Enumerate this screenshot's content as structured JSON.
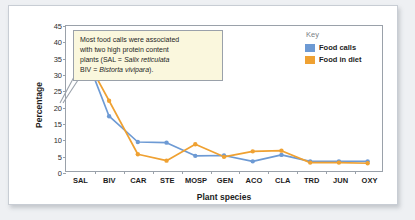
{
  "chart_data": {
    "type": "line",
    "title": "",
    "xlabel": "Plant species",
    "ylabel": "Percentage",
    "categories": [
      "SAL",
      "BIV",
      "CAR",
      "STE",
      "MOSP",
      "GEN",
      "ACO",
      "CLA",
      "TRD",
      "JUN",
      "OXY"
    ],
    "ylim": [
      0,
      45
    ],
    "yticks": [
      0,
      5,
      10,
      15,
      20,
      25,
      30,
      35,
      40,
      45
    ],
    "grid": false,
    "legend_position": "top-right",
    "series": [
      {
        "name": "Food calls",
        "color": "#6d9ad4",
        "values": [
          40,
          17,
          9,
          8.8,
          4.7,
          4.8,
          3,
          5,
          3,
          3,
          3
        ]
      },
      {
        "name": "Food in diet",
        "color": "#efa132",
        "values": [
          38.2,
          21.8,
          5.2,
          3.2,
          8.3,
          4.4,
          6.1,
          6.3,
          2.6,
          2.6,
          2.4
        ]
      }
    ]
  },
  "legend": {
    "title": "Key",
    "items": [
      {
        "label": "Food calls",
        "color": "#6d9ad4"
      },
      {
        "label": "Food in diet",
        "color": "#efa132"
      }
    ]
  },
  "callout": {
    "line1": "Most food calls were associated",
    "line2": "with two high protein content",
    "line3_prefix": "plants (SAL = ",
    "line3_italic": "Salix reticulata",
    "line4_prefix": "BIV = ",
    "line4_italic": "Bistorta vivipara",
    "line4_suffix": ")."
  }
}
